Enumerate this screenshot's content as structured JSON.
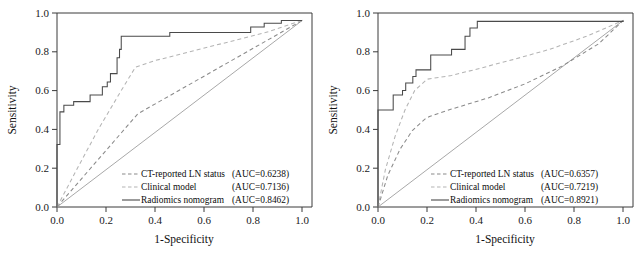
{
  "figure": {
    "panels": [
      {
        "id": "left",
        "xlabel": "1-Specificity",
        "ylabel": "Sensitivity",
        "xticks": [
          "0.0",
          "0.2",
          "0.4",
          "0.6",
          "0.8",
          "1.0"
        ],
        "yticks": [
          "0.0",
          "0.2",
          "0.4",
          "0.6",
          "0.8",
          "1.0"
        ],
        "legend": [
          {
            "label": "CT-reported LN status",
            "auc_text": "(AUC=0.6238)",
            "auc": 0.6238,
            "style": "dashed-dark"
          },
          {
            "label": "Clinical model",
            "auc_text": "(AUC=0.7136)",
            "auc": 0.7136,
            "style": "dashed-light"
          },
          {
            "label": "Radiomics nomogram",
            "auc_text": "(AUC=0.8462)",
            "auc": 0.8462,
            "style": "solid"
          }
        ]
      },
      {
        "id": "right",
        "xlabel": "1-Specificity",
        "ylabel": "Sensitivity",
        "xticks": [
          "0.0",
          "0.2",
          "0.4",
          "0.6",
          "0.8",
          "1.0"
        ],
        "yticks": [
          "0.0",
          "0.2",
          "0.4",
          "0.6",
          "0.8",
          "1.0"
        ],
        "legend": [
          {
            "label": "CT-reported LN status",
            "auc_text": "(AUC=0.6357)",
            "auc": 0.6357,
            "style": "dashed-dark"
          },
          {
            "label": "Clinical model",
            "auc_text": "(AUC=0.7219)",
            "auc": 0.7219,
            "style": "dashed-light"
          },
          {
            "label": "Radiomics nomogram",
            "auc_text": "(AUC=0.8921)",
            "auc": 0.8921,
            "style": "solid"
          }
        ]
      }
    ]
  },
  "chart_data": [
    {
      "type": "line",
      "panel": "left",
      "title": "",
      "xlabel": "1-Specificity",
      "ylabel": "Sensitivity",
      "xlim": [
        0.0,
        1.04
      ],
      "ylim": [
        0.0,
        1.04
      ],
      "xticks": [
        0.0,
        0.2,
        0.4,
        0.6,
        0.8,
        1.0
      ],
      "yticks": [
        0.0,
        0.2,
        0.4,
        0.6,
        0.8,
        1.0
      ],
      "grid": false,
      "legend_position": "lower-right",
      "series": [
        {
          "name": "CT-reported LN status",
          "auc": 0.6238,
          "style": "dashed-dark",
          "points": [
            [
              0.0,
              0.0
            ],
            [
              0.33,
              0.5
            ],
            [
              1.0,
              1.0
            ]
          ]
        },
        {
          "name": "Clinical model",
          "auc": 0.7136,
          "style": "dashed-light",
          "points": [
            [
              0.0,
              0.0
            ],
            [
              0.08,
              0.2
            ],
            [
              0.17,
              0.42
            ],
            [
              0.26,
              0.62
            ],
            [
              0.32,
              0.75
            ],
            [
              0.4,
              0.785
            ],
            [
              0.55,
              0.835
            ],
            [
              0.7,
              0.885
            ],
            [
              0.85,
              0.935
            ],
            [
              1.0,
              1.0
            ]
          ]
        },
        {
          "name": "Radiomics nomogram",
          "auc": 0.8462,
          "style": "solid",
          "points": [
            [
              0.0,
              0.0
            ],
            [
              0.0,
              0.335
            ],
            [
              0.012,
              0.335
            ],
            [
              0.012,
              0.51
            ],
            [
              0.028,
              0.51
            ],
            [
              0.028,
              0.545
            ],
            [
              0.068,
              0.545
            ],
            [
              0.068,
              0.565
            ],
            [
              0.135,
              0.565
            ],
            [
              0.135,
              0.6
            ],
            [
              0.185,
              0.6
            ],
            [
              0.185,
              0.645
            ],
            [
              0.205,
              0.645
            ],
            [
              0.205,
              0.67
            ],
            [
              0.218,
              0.67
            ],
            [
              0.218,
              0.715
            ],
            [
              0.245,
              0.715
            ],
            [
              0.245,
              0.8
            ],
            [
              0.255,
              0.8
            ],
            [
              0.255,
              0.845
            ],
            [
              0.262,
              0.845
            ],
            [
              0.262,
              0.915
            ],
            [
              0.46,
              0.915
            ],
            [
              0.46,
              0.935
            ],
            [
              0.79,
              0.935
            ],
            [
              0.79,
              0.965
            ],
            [
              0.845,
              0.965
            ],
            [
              0.845,
              0.985
            ],
            [
              0.915,
              0.985
            ],
            [
              0.915,
              1.0
            ],
            [
              1.0,
              1.0
            ]
          ]
        },
        {
          "name": "reference-diagonal",
          "auc": 0.5,
          "style": "reference",
          "points": [
            [
              0.0,
              0.0
            ],
            [
              1.0,
              1.0
            ]
          ]
        }
      ]
    },
    {
      "type": "line",
      "panel": "right",
      "title": "",
      "xlabel": "1-Specificity",
      "ylabel": "Sensitivity",
      "xlim": [
        0.0,
        1.04
      ],
      "ylim": [
        0.0,
        1.04
      ],
      "xticks": [
        0.0,
        0.2,
        0.4,
        0.6,
        0.8,
        1.0
      ],
      "yticks": [
        0.0,
        0.2,
        0.4,
        0.6,
        0.8,
        1.0
      ],
      "grid": false,
      "legend_position": "lower-right",
      "series": [
        {
          "name": "CT-reported LN status",
          "auc": 0.6357,
          "style": "dashed-dark",
          "points": [
            [
              0.0,
              0.0
            ],
            [
              0.04,
              0.17
            ],
            [
              0.09,
              0.31
            ],
            [
              0.14,
              0.41
            ],
            [
              0.19,
              0.47
            ],
            [
              0.21,
              0.485
            ],
            [
              0.3,
              0.525
            ],
            [
              0.45,
              0.585
            ],
            [
              0.6,
              0.66
            ],
            [
              0.75,
              0.755
            ],
            [
              0.9,
              0.875
            ],
            [
              1.0,
              1.0
            ]
          ]
        },
        {
          "name": "Clinical model",
          "auc": 0.7219,
          "style": "dashed-light",
          "points": [
            [
              0.0,
              0.0
            ],
            [
              0.03,
              0.2
            ],
            [
              0.07,
              0.38
            ],
            [
              0.11,
              0.52
            ],
            [
              0.15,
              0.625
            ],
            [
              0.2,
              0.685
            ],
            [
              0.3,
              0.705
            ],
            [
              0.42,
              0.745
            ],
            [
              0.55,
              0.79
            ],
            [
              0.7,
              0.845
            ],
            [
              0.85,
              0.915
            ],
            [
              1.0,
              1.0
            ]
          ]
        },
        {
          "name": "Radiomics nomogram",
          "auc": 0.8921,
          "style": "solid",
          "points": [
            [
              0.0,
              0.0
            ],
            [
              0.0,
              0.52
            ],
            [
              0.062,
              0.52
            ],
            [
              0.062,
              0.6
            ],
            [
              0.1,
              0.6
            ],
            [
              0.1,
              0.625
            ],
            [
              0.113,
              0.625
            ],
            [
              0.113,
              0.665
            ],
            [
              0.142,
              0.665
            ],
            [
              0.142,
              0.7
            ],
            [
              0.155,
              0.7
            ],
            [
              0.155,
              0.735
            ],
            [
              0.215,
              0.735
            ],
            [
              0.215,
              0.815
            ],
            [
              0.3,
              0.815
            ],
            [
              0.3,
              0.845
            ],
            [
              0.355,
              0.845
            ],
            [
              0.355,
              0.915
            ],
            [
              0.375,
              0.915
            ],
            [
              0.375,
              0.96
            ],
            [
              0.405,
              0.96
            ],
            [
              0.405,
              0.995
            ],
            [
              1.0,
              0.995
            ],
            [
              1.0,
              1.0
            ]
          ]
        },
        {
          "name": "reference-diagonal",
          "auc": 0.5,
          "style": "reference",
          "points": [
            [
              0.0,
              0.0
            ],
            [
              1.0,
              1.0
            ]
          ]
        }
      ]
    }
  ]
}
